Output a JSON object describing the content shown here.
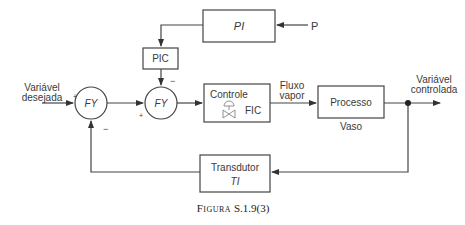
{
  "diagram": {
    "blocks": {
      "pi": {
        "label": "PI"
      },
      "pic": {
        "label": "PIC"
      },
      "fy1": {
        "label": "FY"
      },
      "fy2": {
        "label": "FY"
      },
      "controle": {
        "label": "Controle",
        "sublabel": "FIC"
      },
      "processo": {
        "label": "Processo",
        "sublabel": "Vaso"
      },
      "transdutor": {
        "label": "Transdutor",
        "sublabel": "TI"
      }
    },
    "signals": {
      "input": {
        "line1": "Variável",
        "line2": "desejada"
      },
      "pressure": "P",
      "flow": {
        "line1": "Fluxo",
        "line2": "vapor"
      },
      "output": {
        "line1": "Variável",
        "line2": "controlada"
      }
    },
    "signs": {
      "fy1_input": "+",
      "fy1_feedback": "−",
      "fy2_pic": "−",
      "fy2_input": "+"
    }
  },
  "caption": {
    "prefix": "Figura",
    "number": "S.1.9(3)"
  }
}
